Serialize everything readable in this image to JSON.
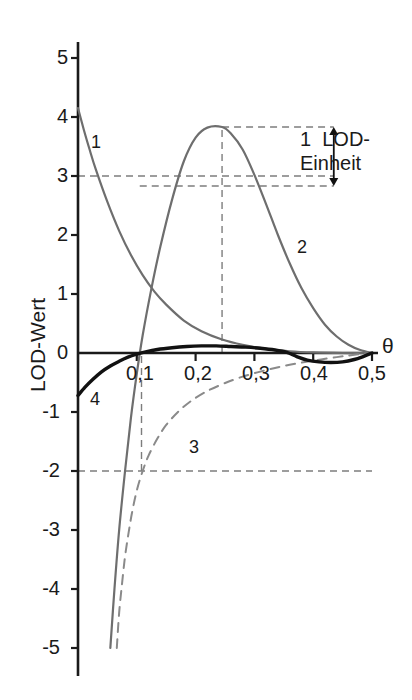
{
  "chart_data": {
    "type": "line",
    "title": "",
    "xlabel": "θ",
    "ylabel": "LOD-Wert",
    "xlim": [
      0,
      0.5
    ],
    "ylim": [
      -5,
      5.4
    ],
    "grid": false,
    "legend_position": "inline-curve-labels",
    "x_ticks": [
      "0,1",
      "0,2",
      "0,3",
      "0,4",
      "0,5"
    ],
    "x_tick_values": [
      0.1,
      0.2,
      0.3,
      0.4,
      0.5
    ],
    "y_ticks": [
      "5",
      "4",
      "3",
      "2",
      "1",
      "0",
      "-1",
      "-2",
      "-3",
      "-4",
      "-5"
    ],
    "y_tick_values": [
      5,
      4,
      3,
      2,
      1,
      0,
      -1,
      -2,
      -3,
      -4,
      -5
    ],
    "series": [
      {
        "name": "1",
        "label": "1",
        "color": "#6e6e6e",
        "style": "solid",
        "width": 2.2,
        "points": [
          [
            0.0,
            4.15
          ],
          [
            0.01,
            3.78
          ],
          [
            0.02,
            3.44
          ],
          [
            0.03,
            3.12
          ],
          [
            0.05,
            2.56
          ],
          [
            0.07,
            2.07
          ],
          [
            0.09,
            1.66
          ],
          [
            0.11,
            1.32
          ],
          [
            0.13,
            1.04
          ],
          [
            0.15,
            0.82
          ],
          [
            0.18,
            0.55
          ],
          [
            0.21,
            0.37
          ],
          [
            0.245,
            0.23
          ],
          [
            0.28,
            0.14
          ],
          [
            0.32,
            0.07
          ],
          [
            0.36,
            0.03
          ],
          [
            0.4,
            0.01
          ],
          [
            0.45,
            0.0
          ],
          [
            0.5,
            0.0
          ]
        ]
      },
      {
        "name": "2",
        "label": "2",
        "color": "#6e6e6e",
        "style": "solid",
        "width": 2.2,
        "points": [
          [
            0.055,
            -5.0
          ],
          [
            0.062,
            -4.0
          ],
          [
            0.07,
            -3.0
          ],
          [
            0.08,
            -2.0
          ],
          [
            0.09,
            -1.1
          ],
          [
            0.1,
            -0.35
          ],
          [
            0.11,
            0.3
          ],
          [
            0.125,
            1.1
          ],
          [
            0.14,
            1.8
          ],
          [
            0.16,
            2.6
          ],
          [
            0.18,
            3.25
          ],
          [
            0.2,
            3.65
          ],
          [
            0.22,
            3.82
          ],
          [
            0.245,
            3.83
          ],
          [
            0.26,
            3.72
          ],
          [
            0.28,
            3.45
          ],
          [
            0.3,
            3.02
          ],
          [
            0.32,
            2.52
          ],
          [
            0.34,
            2.0
          ],
          [
            0.36,
            1.52
          ],
          [
            0.38,
            1.1
          ],
          [
            0.4,
            0.76
          ],
          [
            0.42,
            0.48
          ],
          [
            0.44,
            0.28
          ],
          [
            0.46,
            0.14
          ],
          [
            0.48,
            0.05
          ],
          [
            0.5,
            0.0
          ]
        ]
      },
      {
        "name": "3",
        "label": "3",
        "color": "#8a8a8a",
        "style": "dashed",
        "width": 2.0,
        "points": [
          [
            0.066,
            -5.0
          ],
          [
            0.07,
            -4.4
          ],
          [
            0.075,
            -3.9
          ],
          [
            0.08,
            -3.45
          ],
          [
            0.086,
            -3.05
          ],
          [
            0.092,
            -2.7
          ],
          [
            0.1,
            -2.33
          ],
          [
            0.11,
            -2.0
          ],
          [
            0.12,
            -1.74
          ],
          [
            0.135,
            -1.45
          ],
          [
            0.15,
            -1.22
          ],
          [
            0.17,
            -1.0
          ],
          [
            0.19,
            -0.83
          ],
          [
            0.215,
            -0.67
          ],
          [
            0.245,
            -0.53
          ],
          [
            0.28,
            -0.4
          ],
          [
            0.32,
            -0.29
          ],
          [
            0.36,
            -0.2
          ],
          [
            0.4,
            -0.13
          ],
          [
            0.44,
            -0.07
          ],
          [
            0.47,
            -0.03
          ],
          [
            0.5,
            0.0
          ]
        ]
      },
      {
        "name": "4",
        "label": "4",
        "color": "#111111",
        "style": "solid",
        "width": 3.4,
        "points": [
          [
            0.0,
            -0.72
          ],
          [
            0.012,
            -0.58
          ],
          [
            0.025,
            -0.45
          ],
          [
            0.04,
            -0.32
          ],
          [
            0.055,
            -0.22
          ],
          [
            0.07,
            -0.14
          ],
          [
            0.085,
            -0.07
          ],
          [
            0.1,
            -0.02
          ],
          [
            0.115,
            0.02
          ],
          [
            0.135,
            0.06
          ],
          [
            0.16,
            0.09
          ],
          [
            0.185,
            0.11
          ],
          [
            0.21,
            0.12
          ],
          [
            0.235,
            0.12
          ],
          [
            0.26,
            0.11
          ],
          [
            0.285,
            0.1
          ],
          [
            0.31,
            0.08
          ],
          [
            0.335,
            0.05
          ],
          [
            0.355,
            0.01
          ],
          [
            0.372,
            -0.06
          ],
          [
            0.39,
            -0.12
          ],
          [
            0.41,
            -0.15
          ],
          [
            0.43,
            -0.16
          ],
          [
            0.45,
            -0.15
          ],
          [
            0.47,
            -0.11
          ],
          [
            0.485,
            -0.06
          ],
          [
            0.5,
            0.0
          ]
        ]
      }
    ],
    "reference_lines": [
      {
        "name": "lod-3-line",
        "orientation": "horizontal",
        "value": 3.0,
        "style": "dashed",
        "x_from": 0.0,
        "x_to": 0.435
      },
      {
        "name": "lod-peak-minus-one-line",
        "orientation": "horizontal",
        "value": 2.83,
        "style": "dashed",
        "x_from": 0.105,
        "x_to": 0.435
      },
      {
        "name": "lod-peak-top-line",
        "orientation": "horizontal",
        "value": 3.83,
        "style": "dashed",
        "x_from": 0.245,
        "x_to": 0.435
      },
      {
        "name": "lod-minus-2-line",
        "orientation": "horizontal",
        "value": -2.0,
        "style": "dashed",
        "x_from": 0.0,
        "x_to": 0.5
      },
      {
        "name": "theta-peak-line",
        "orientation": "vertical",
        "value": 0.245,
        "style": "dashed",
        "y_from": 0.0,
        "y_to": 3.83
      },
      {
        "name": "theta-support-line",
        "orientation": "vertical",
        "value": 0.108,
        "style": "dashed",
        "y_from": -2.0,
        "y_to": 0.0
      }
    ],
    "annotations": [
      {
        "name": "lod-unit-annotation",
        "text_line1": "1  LOD-",
        "text_line2": "Einheit",
        "arrow": "double-headed-vertical",
        "from_value": 2.83,
        "to_value": 3.83,
        "at_theta": 0.435
      }
    ]
  },
  "axis": {
    "y_label": "LOD-Wert",
    "x_label": "θ"
  },
  "colors": {
    "curve_gray": "#6e6e6e",
    "curve_dashed_gray": "#8a8a8a",
    "curve_black": "#111111",
    "axis": "#1a1a1a",
    "reference_dashed": "#7d7d7d",
    "background": "#ffffff"
  }
}
